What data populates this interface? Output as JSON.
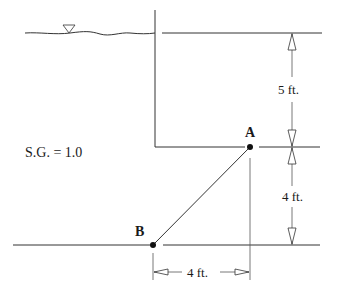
{
  "diagram": {
    "fluid_label": "S.G. = 1.0",
    "points": [
      {
        "name": "A",
        "label": "A"
      },
      {
        "name": "B",
        "label": "B"
      }
    ],
    "dimensions": {
      "surface_to_A": "5 ft.",
      "A_to_bottom": "4 ft.",
      "horizontal_B_to_A": "4 ft."
    },
    "icons": {
      "free_surface": "inverted-triangle-water-surface-symbol"
    },
    "colors": {
      "line": "#333333",
      "text": "#1a1a1a",
      "background": "#ffffff"
    }
  }
}
